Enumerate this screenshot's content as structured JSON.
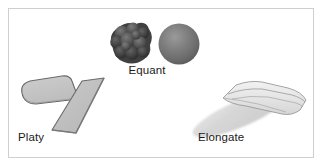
{
  "figure": {
    "background_color": "#ffffff",
    "border_color": "#cfcfcf",
    "labels": [
      {
        "id": "equant",
        "text": "Equant"
      },
      {
        "id": "platy",
        "text": "Platy"
      },
      {
        "id": "elongate",
        "text": "Elongate"
      }
    ],
    "groups": [
      {
        "name": "equant",
        "label": "Equant",
        "shapes": [
          {
            "name": "lumpy-aggregate-blob",
            "style": "dark bumpy cluster of lobes",
            "fill": "#4a4a4a"
          },
          {
            "name": "sphere",
            "style": "shaded gray sphere",
            "fill": "#6f6f6f"
          }
        ]
      },
      {
        "name": "platy",
        "label": "Platy",
        "shapes": [
          {
            "name": "irregular-plate",
            "style": "rounded irregular flat plate",
            "fill": "#c6c6c6"
          },
          {
            "name": "rectangular-slab",
            "style": "tilted rectangular slab",
            "fill": "#c2c2c2"
          }
        ]
      },
      {
        "name": "elongate",
        "label": "Elongate",
        "shapes": [
          {
            "name": "smooth-ellipse",
            "style": "soft-edged elongated ellipse",
            "fill": "#dcdcdc"
          },
          {
            "name": "prismatic-crystal",
            "style": "faceted elongated crystal",
            "fill": "#ededed"
          }
        ]
      }
    ]
  }
}
